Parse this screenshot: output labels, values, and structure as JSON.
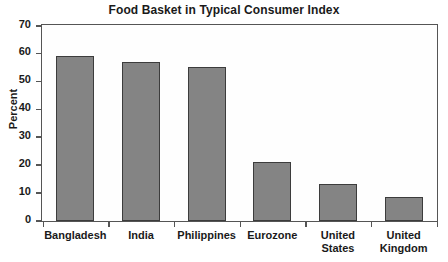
{
  "chart_data": {
    "type": "bar",
    "title": "Food Basket in Typical Consumer Index",
    "xlabel": "",
    "ylabel": "Percent",
    "categories": [
      "Bangladesh",
      "India",
      "Philippines",
      "Eurozone",
      "United States",
      "United Kingdom"
    ],
    "values": [
      59,
      57,
      55,
      21,
      13,
      8.5
    ],
    "ylim": [
      0,
      70
    ],
    "ytick_values": [
      70,
      60,
      50,
      40,
      30,
      20,
      10,
      0
    ],
    "ytick_labels": [
      "70",
      "60",
      "50",
      "40",
      "30",
      "20",
      "10",
      "0"
    ],
    "grid": false,
    "legend": null,
    "legend_position": "none",
    "bar_color": "#848484",
    "bar_edge_color": "#3c3c3c",
    "axis_color": "#555555",
    "text_color": "#1a1a1a",
    "plot_background": "#fefefe"
  }
}
